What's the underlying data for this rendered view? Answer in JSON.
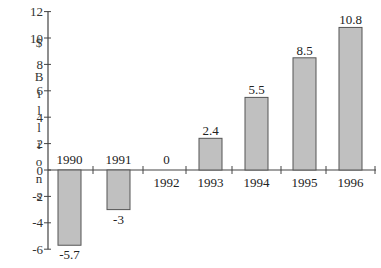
{
  "chart_data": {
    "type": "bar",
    "title": "",
    "xlabel": "",
    "ylabel": "$ Billions",
    "ylabel_chars": [
      "$",
      "",
      "B",
      "i",
      "l",
      "l",
      "i",
      "o",
      "n",
      "s"
    ],
    "categories": [
      "1990",
      "1991",
      "1992",
      "1993",
      "1994",
      "1995",
      "1996"
    ],
    "values": [
      -5.7,
      -3,
      0,
      2.4,
      5.5,
      8.5,
      10.8
    ],
    "value_labels": [
      "-5.7",
      "-3",
      "0",
      "2.4",
      "5.5",
      "8.5",
      "10.8"
    ],
    "ylim": [
      -6,
      12
    ],
    "yticks": [
      -6,
      -4,
      -2,
      0,
      2,
      4,
      6,
      8,
      10,
      12
    ],
    "ytick_labels": [
      "-6",
      "-4",
      "-2",
      "0",
      "2",
      "4",
      "6",
      "8",
      "10",
      "12"
    ],
    "grid": false,
    "legend": null,
    "bar_color": "#c0c0c0",
    "bar_edge_color": "#555555"
  }
}
